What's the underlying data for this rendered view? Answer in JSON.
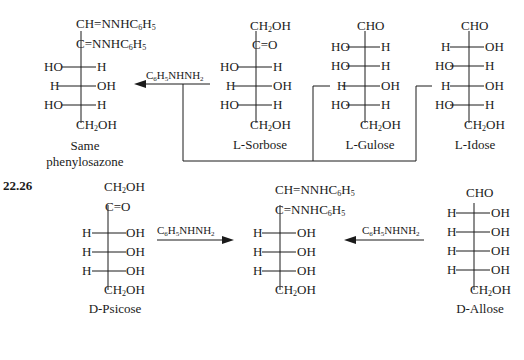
{
  "problem_number": "22.26",
  "reagent": "C6H5NHNH2",
  "top_row": {
    "product": {
      "name_line1": "Same",
      "name_line2": "phenylosazone",
      "c1": "CH=NNHC6H5",
      "c2": "C=NNHC6H5",
      "rows": [
        {
          "left": "HO",
          "right": "H"
        },
        {
          "left": "H",
          "right": "OH"
        },
        {
          "left": "HO",
          "right": "H"
        }
      ],
      "bottom": "CH2OH"
    },
    "l_sorbose": {
      "name": "L-Sorbose",
      "c1": "CH2OH",
      "c2": "C=O",
      "rows": [
        {
          "left": "HO",
          "right": "H"
        },
        {
          "left": "H",
          "right": "OH"
        },
        {
          "left": "HO",
          "right": "H"
        }
      ],
      "bottom": "CH2OH"
    },
    "l_gulose": {
      "name": "L-Gulose",
      "c1": "CHO",
      "rows": [
        {
          "left": "HO",
          "right": "H"
        },
        {
          "left": "HO",
          "right": "H"
        },
        {
          "left": "H",
          "right": "OH"
        },
        {
          "left": "HO",
          "right": "H"
        }
      ],
      "bottom": "CH2OH"
    },
    "l_idose": {
      "name": "L-Idose",
      "c1": "CHO",
      "rows": [
        {
          "left": "H",
          "right": "OH"
        },
        {
          "left": "HO",
          "right": "H"
        },
        {
          "left": "H",
          "right": "OH"
        },
        {
          "left": "HO",
          "right": "H"
        }
      ],
      "bottom": "CH2OH"
    }
  },
  "bottom_row": {
    "d_psicose": {
      "name": "D-Psicose",
      "c1": "CH2OH",
      "c2": "C=O",
      "rows": [
        {
          "left": "H",
          "right": "OH"
        },
        {
          "left": "H",
          "right": "OH"
        },
        {
          "left": "H",
          "right": "OH"
        }
      ],
      "bottom": "CH2OH"
    },
    "product": {
      "c1": "CH=NNHC6H5",
      "c2": "C=NNHC6H5",
      "rows": [
        {
          "left": "H",
          "right": "OH"
        },
        {
          "left": "H",
          "right": "OH"
        },
        {
          "left": "H",
          "right": "OH"
        }
      ],
      "bottom": "CH2OH"
    },
    "d_allose": {
      "name": "D-Allose",
      "c1": "CHO",
      "rows": [
        {
          "left": "H",
          "right": "OH"
        },
        {
          "left": "H",
          "right": "OH"
        },
        {
          "left": "H",
          "right": "OH"
        },
        {
          "left": "H",
          "right": "OH"
        }
      ],
      "bottom": "CH2OH"
    }
  }
}
